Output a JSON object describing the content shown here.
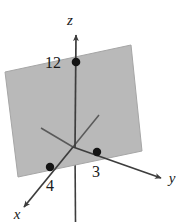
{
  "figure": {
    "type": "3d-coordinate-plane-diagram",
    "background_color": "#ffffff",
    "plane": {
      "fill_color": "#b9b9b9",
      "stroke_color": "#9a9a9a",
      "opacity": 1
    },
    "axis_color": "#3d3d3d",
    "dot_color": "#141414",
    "axes": [
      {
        "name": "z-axis",
        "label": "z",
        "label_x": 69,
        "label_y": 24
      },
      {
        "name": "y-axis",
        "label": "y",
        "label_x": 171,
        "label_y": 182
      },
      {
        "name": "x-axis",
        "label": "x",
        "label_x": 17,
        "label_y": 218
      }
    ],
    "intercepts": [
      {
        "name": "z-intercept",
        "label": "12",
        "dot_x": 76,
        "dot_y": 62,
        "label_x": 53,
        "label_y": 62
      },
      {
        "name": "y-intercept",
        "label": "3",
        "dot_x": 97,
        "dot_y": 152,
        "label_x": 94,
        "label_y": 175
      },
      {
        "name": "x-intercept",
        "label": "4",
        "dot_x": 50,
        "dot_y": 167,
        "label_x": 47,
        "label_y": 190
      }
    ]
  }
}
